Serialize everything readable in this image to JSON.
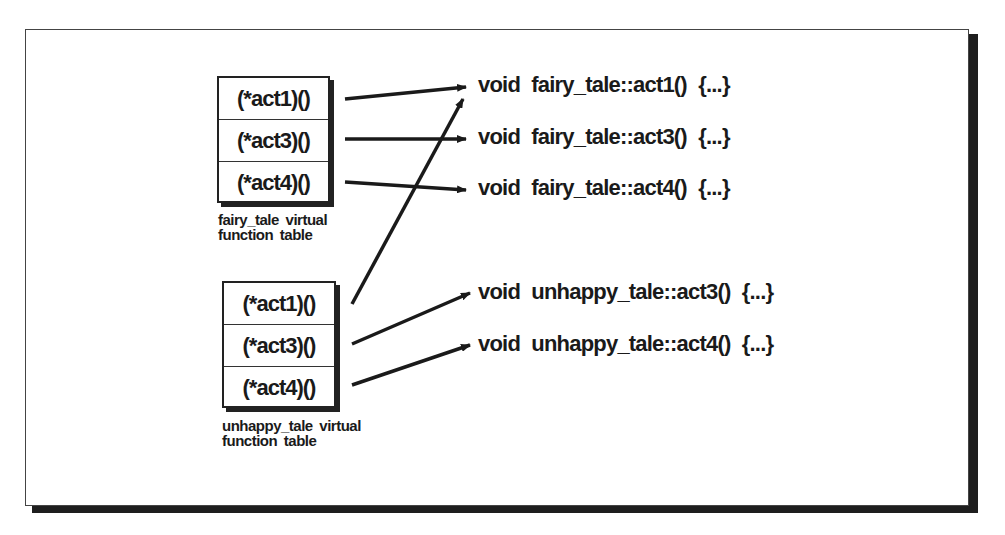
{
  "fairy_table": {
    "entries": [
      "(*act1)()",
      "(*act3)()",
      "(*act4)()"
    ],
    "caption_line1": "fairy_tale virtual",
    "caption_line2": "function table"
  },
  "unhappy_table": {
    "entries": [
      "(*act1)()",
      "(*act3)()",
      "(*act4)()"
    ],
    "caption_line1": "unhappy_tale virtual",
    "caption_line2": "function table"
  },
  "implementations": [
    "void fairy_tale::act1() {...}",
    "void fairy_tale::act3() {...}",
    "void fairy_tale::act4() {...}",
    "void unhappy_tale::act3() {...}",
    "void unhappy_tale::act4() {...}"
  ],
  "colors": {
    "ink": "#1a1a1a",
    "background": "#ffffff"
  }
}
